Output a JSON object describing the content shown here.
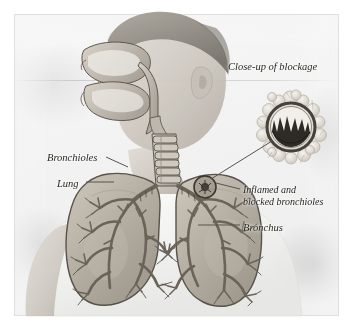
{
  "figure": {
    "type": "medical-illustration",
    "medium": "anatomical overlay on desaturated photograph of a boy in profile"
  },
  "labels": {
    "closeup": "Close-up of blockage",
    "bronchioles": "Bronchioles",
    "lung": "Lung",
    "inflamed": "Inflamed and blocked bronchioles",
    "inflamed_line1": "Inflamed and",
    "inflamed_line2": "blocked bronchioles",
    "bronchus": "Bronchus"
  },
  "anatomy": {
    "nasal_cavity": "nasal-cavity",
    "pharynx": "pharynx",
    "trachea": "trachea",
    "left_lung": "left-lung",
    "right_lung": "right-lung",
    "bronchial_tree": "bronchial-tree",
    "blockage_marker": "inflamed-region-marker",
    "closeup_ring": "bronchiole-cross-section"
  },
  "colors": {
    "label_text": "#2b2722",
    "leader_line": "#57544f",
    "lung_tissue": "#b9b3a9",
    "lung_outline": "#5d584f",
    "bronchi": "#6a6358",
    "blockage_dark": "#2e2a25",
    "skin": "#cfc9c1",
    "background": "#f2f2f1"
  }
}
